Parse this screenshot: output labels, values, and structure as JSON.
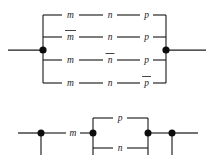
{
  "figure": {
    "background_color": "#ffffff",
    "line_color": "#1c1c1c",
    "label_color": "#232323",
    "node_color": "#0d0d0d"
  },
  "top_circuit": {
    "name": "four-branch-parallel-network",
    "left_terminal_label": "",
    "right_terminal_label": "",
    "branches": [
      {
        "index": 1,
        "elements": [
          {
            "symbol": "m",
            "negated": false
          },
          {
            "symbol": "n",
            "negated": false
          },
          {
            "symbol": "p",
            "negated": false
          }
        ]
      },
      {
        "index": 2,
        "elements": [
          {
            "symbol": "m",
            "negated": true
          },
          {
            "symbol": "n",
            "negated": false
          },
          {
            "symbol": "p",
            "negated": false
          }
        ]
      },
      {
        "index": 3,
        "elements": [
          {
            "symbol": "m",
            "negated": false
          },
          {
            "symbol": "n",
            "negated": true
          },
          {
            "symbol": "p",
            "negated": false
          }
        ]
      },
      {
        "index": 4,
        "elements": [
          {
            "symbol": "m",
            "negated": false
          },
          {
            "symbol": "n",
            "negated": false
          },
          {
            "symbol": "p",
            "negated": true
          }
        ]
      }
    ],
    "junction_nodes": 2
  },
  "bottom_circuit": {
    "name": "series-parallel-network",
    "series_element": {
      "symbol": "m",
      "negated": false
    },
    "parallel_elements": [
      {
        "symbol": "p",
        "negated": false,
        "position": "top"
      },
      {
        "symbol": "n",
        "negated": false,
        "position": "bottom"
      }
    ],
    "junction_nodes": 4
  }
}
